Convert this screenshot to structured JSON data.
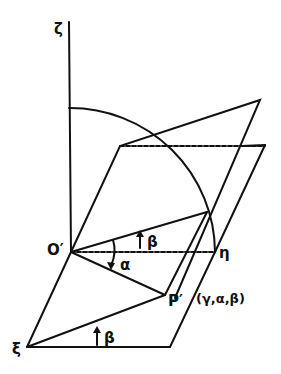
{
  "diagram": {
    "type": "geometric rotation diagram",
    "labels": {
      "zeta": "ζ",
      "origin": "O′",
      "eta": "η",
      "xi": "ξ",
      "point": "P′",
      "coords": "(γ,α,β)",
      "alpha": "α",
      "beta_upper": "β",
      "beta_lower": "β"
    },
    "colors": {
      "line": "#111111",
      "background": "#ffffff"
    }
  }
}
